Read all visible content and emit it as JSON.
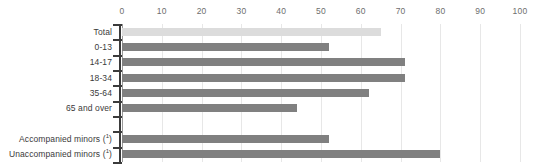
{
  "chart_data": {
    "type": "bar",
    "orientation": "horizontal",
    "title": "",
    "subtitle": "",
    "xlabel": "",
    "ylabel": "",
    "xlim": [
      0,
      100
    ],
    "xticks": [
      0,
      10,
      20,
      30,
      40,
      50,
      60,
      70,
      80,
      90,
      100
    ],
    "xtick_labels": [
      "0",
      "10",
      "20",
      "30",
      "40",
      "50",
      "60",
      "70",
      "80",
      "90",
      "100"
    ],
    "grid": true,
    "legend": "none",
    "categories": [
      "Total",
      "0-13",
      "14-17",
      "18-34",
      "35-64",
      "65 and over",
      "",
      "Accompanied minors (¹)",
      "Unaccompanied minors (¹)"
    ],
    "category_labels": [
      {
        "text": "Total",
        "footnote": ""
      },
      {
        "text": "0-13",
        "footnote": ""
      },
      {
        "text": "14-17",
        "footnote": ""
      },
      {
        "text": "18-34",
        "footnote": ""
      },
      {
        "text": "35-64",
        "footnote": ""
      },
      {
        "text": "65 and over",
        "footnote": ""
      },
      {
        "text": "",
        "footnote": ""
      },
      {
        "text": "Accompanied minors ",
        "footnote": "1"
      },
      {
        "text": "Unaccompanied minors ",
        "footnote": "1"
      }
    ],
    "values": [
      65,
      52,
      71,
      71,
      62,
      44,
      null,
      52,
      80
    ],
    "bar_colors": [
      "#dcdcdc",
      "#808080",
      "#808080",
      "#808080",
      "#808080",
      "#808080",
      null,
      "#808080",
      "#808080"
    ],
    "series": [
      {
        "name": "share",
        "values": [
          65,
          52,
          71,
          71,
          62,
          44,
          null,
          52,
          80
        ]
      }
    ],
    "colors": {
      "highlight_bar": "#dcdcdc",
      "standard_bar": "#808080",
      "gridline": "#e7e7e7",
      "axis": "#3b3b3b",
      "tick_text": "#6e6e6e",
      "category_text": "#3a3a3a",
      "background": "#ffffff"
    },
    "annotations": []
  }
}
